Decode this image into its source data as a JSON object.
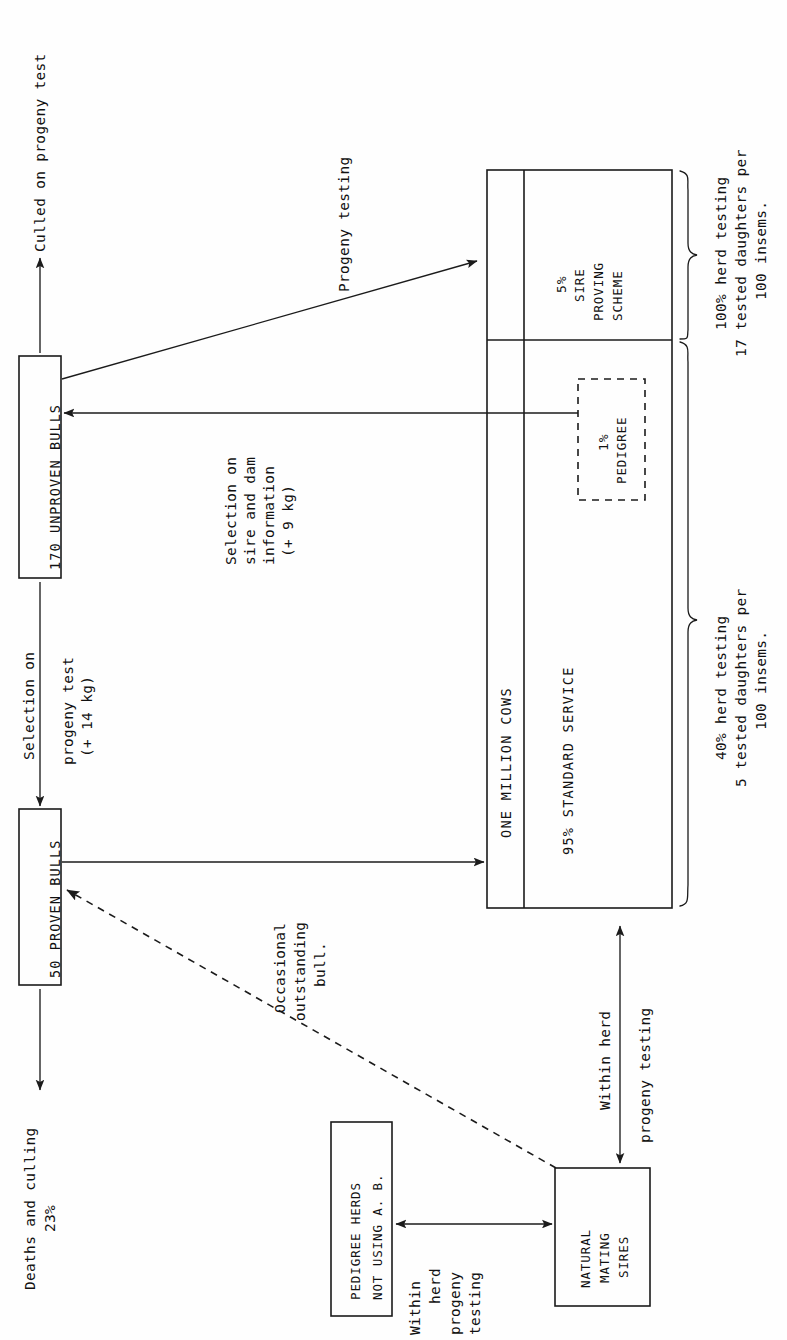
{
  "figure": {
    "orientation": "landscape figure rotated 90 degrees on a portrait page"
  },
  "boxes": {
    "unproven_bulls": {
      "label": "170 UNPROVEN BULLS"
    },
    "proven_bulls": {
      "label": "50 PROVEN BULLS"
    },
    "pedigree_herds": {
      "line1": "PEDIGREE HERDS",
      "line2": "NOT USING A. B."
    },
    "natural_mating_sires": {
      "line1": "NATURAL",
      "line2": "MATING",
      "line3": "SIRES"
    },
    "cows": {
      "title": "ONE MILLION COWS",
      "sire_proving": {
        "pct": "5%",
        "line1": "SIRE",
        "line2": "PROVING",
        "line3": "SCHEME"
      },
      "standard_service": {
        "label": "95% STANDARD SERVICE"
      },
      "pedigree": {
        "pct": "1%",
        "label": "PEDIGREE"
      }
    }
  },
  "annotations": {
    "culled_on_progeny_test": "Culled on progeny test",
    "progeny_testing": "Progeny testing",
    "selection_sire_dam": {
      "line1": "Selection on",
      "line2": "sire and dam",
      "line3": "information",
      "line4": "(+ 9 kg)"
    },
    "selection_progeny": {
      "line1": "Selection on",
      "line2": "progeny test",
      "line3": "(+ 14 kg)"
    },
    "deaths_culling": {
      "line1": "Deaths and culling",
      "line2": "23%"
    },
    "occasional_bull": {
      "line1": "Occasional",
      "line2": "outstanding",
      "line3": "bull."
    },
    "within_herd_progeny_testing_vertical": {
      "line1": "Within herd",
      "line2": "progeny testing"
    },
    "within_herd_progeny_testing_horizontal": {
      "line1": "Within",
      "line2": "herd",
      "line3": "progeny",
      "line4": "testing"
    }
  },
  "braces": {
    "upper": {
      "line1": "100% herd testing",
      "line2": "17 tested daughters per",
      "line3": "100 insems."
    },
    "lower": {
      "line1": "40% herd testing",
      "line2": "5 tested daughters per",
      "line3": "100 insems."
    }
  },
  "colors": {
    "ink": "#1b1b1b",
    "paper": "#fefefe"
  }
}
